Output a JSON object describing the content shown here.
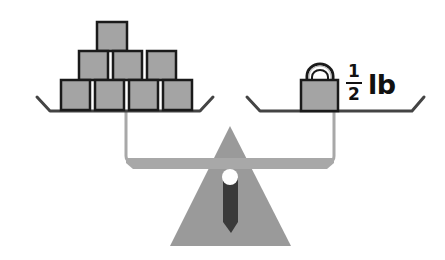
{
  "diagram": {
    "colors": {
      "block_fill": "#a4a4a4",
      "outline": "#1a1a1a",
      "beam": "#a8a8a8",
      "fulcrum": "#9a9a9a",
      "needle": "#3a3a3a",
      "pivot": "#ffffff",
      "pan_line": "#555555"
    },
    "left_pan": {
      "item": "cube",
      "count": 10,
      "rows": [
        {
          "row": "top",
          "count": 1
        },
        {
          "row": "middle",
          "count": 3
        },
        {
          "row": "bottom",
          "count": 4
        }
      ]
    },
    "right_pan": {
      "item": "padlock-weight",
      "count": 1,
      "label": {
        "numerator": "1",
        "denominator": "2",
        "unit": "lb"
      }
    }
  }
}
